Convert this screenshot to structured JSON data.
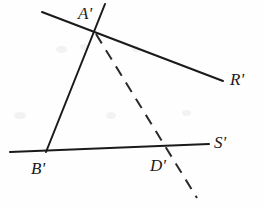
{
  "figure": {
    "type": "geometry-diagram",
    "background_color": "#fefefe",
    "stroke_color": "#1a1a1a",
    "dashed_stroke_color": "#2a2a2a",
    "width": 264,
    "height": 209
  },
  "labels": {
    "a_prime": "A'",
    "b_prime": "B'",
    "d_prime": "D'",
    "r_prime": "R'",
    "s_prime": "S'"
  },
  "label_positions": {
    "a_prime": {
      "x": 78,
      "y": 19
    },
    "b_prime": {
      "x": 31,
      "y": 174
    },
    "d_prime": {
      "x": 150,
      "y": 171
    },
    "r_prime": {
      "x": 230,
      "y": 85
    },
    "s_prime": {
      "x": 214,
      "y": 148
    }
  },
  "segments": [
    {
      "name": "ray-R-prime",
      "style": "solid",
      "from": {
        "x": 42,
        "y": 12
      },
      "to": {
        "x": 223,
        "y": 81
      }
    },
    {
      "name": "ray-S-prime",
      "style": "solid",
      "from": {
        "x": 10,
        "y": 152
      },
      "to": {
        "x": 209,
        "y": 144
      }
    },
    {
      "name": "segment-A-prime-B-prime",
      "style": "solid",
      "from": {
        "x": 105,
        "y": 4
      },
      "to": {
        "x": 46,
        "y": 152
      }
    },
    {
      "name": "dashed-cevian-A-prime-D-prime",
      "style": "dashed",
      "from": {
        "x": 96,
        "y": 34
      },
      "to": {
        "x": 197,
        "y": 198
      }
    }
  ],
  "vertices": [
    {
      "name": "A-prime",
      "x": 96,
      "y": 34
    },
    {
      "name": "B-prime",
      "x": 46,
      "y": 152
    },
    {
      "name": "D-prime",
      "x": 164,
      "y": 147
    }
  ]
}
